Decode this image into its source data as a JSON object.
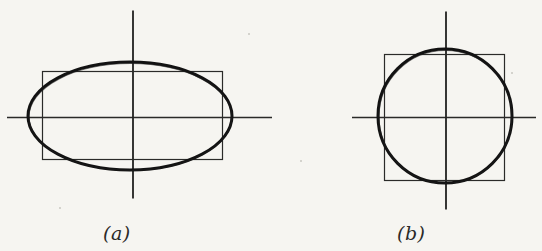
{
  "page": {
    "width": 542,
    "height": 251,
    "background_color": "#f6f5f1",
    "ink_color": "#1a1a1a",
    "thin_ink_color": "#333333"
  },
  "captions": {
    "a": "(a)",
    "b": "(b)"
  },
  "chart_data": {
    "type": "diagram",
    "title": "",
    "panels": [
      {
        "id": "a",
        "label": "(a)",
        "center": [
          133,
          117
        ],
        "shapes": [
          {
            "name": "ellipse",
            "type": "ellipse",
            "cx": 130,
            "cy": 116,
            "rx": 102,
            "ry": 54,
            "stroke_width": 3.0
          },
          {
            "name": "rectangle",
            "type": "rect",
            "x": 42,
            "y": 71,
            "width": 180,
            "height": 88,
            "stroke_width": 1.2
          },
          {
            "name": "horizontal-axis",
            "type": "line",
            "x1": 7,
            "y1": 117,
            "x2": 272,
            "y2": 117,
            "stroke_width": 1.4
          },
          {
            "name": "vertical-axis",
            "type": "line",
            "x1": 133,
            "y1": 10,
            "x2": 133,
            "y2": 198,
            "stroke_width": 1.8
          }
        ]
      },
      {
        "id": "b",
        "label": "(b)",
        "center": [
          446,
          117
        ],
        "shapes": [
          {
            "name": "circle",
            "type": "circle",
            "cx": 445,
            "cy": 116,
            "r": 67,
            "stroke_width": 3.0
          },
          {
            "name": "square",
            "type": "rect",
            "x": 384,
            "y": 54,
            "width": 120,
            "height": 126,
            "stroke_width": 1.2
          },
          {
            "name": "horizontal-axis",
            "type": "line",
            "x1": 352,
            "y1": 117,
            "x2": 536,
            "y2": 117,
            "stroke_width": 1.4
          },
          {
            "name": "vertical-axis",
            "type": "line",
            "x1": 446,
            "y1": 11,
            "x2": 446,
            "y2": 209,
            "stroke_width": 1.8
          }
        ]
      }
    ],
    "xlabel": "",
    "ylabel": "",
    "grid": false,
    "legend": null
  }
}
